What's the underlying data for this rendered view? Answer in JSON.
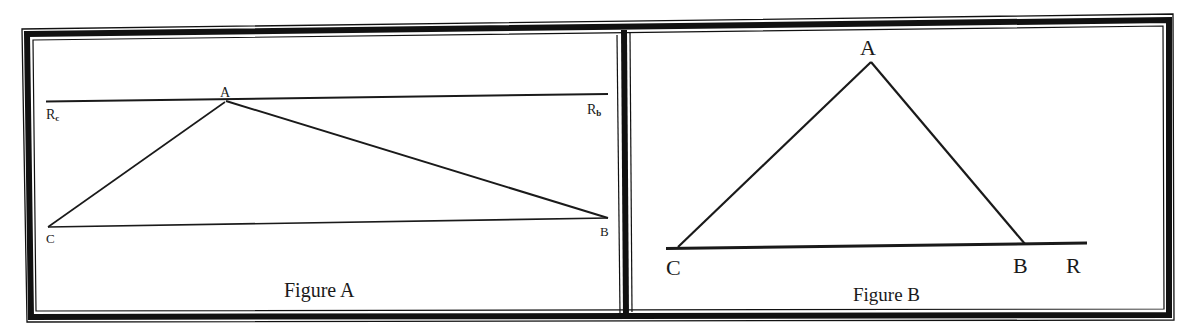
{
  "figures": [
    {
      "id": "A",
      "caption": "Figure A",
      "points": {
        "A": {
          "label": "A",
          "x": 226,
          "y": 101
        },
        "B": {
          "label": "B",
          "x": 608,
          "y": 218
        },
        "C": {
          "label": "C",
          "x": 48,
          "y": 227
        }
      },
      "line_labels": {
        "left": {
          "main": "R",
          "sub": "c"
        },
        "right": {
          "main": "R",
          "sub": "b"
        }
      },
      "description": "Triangle ABC with a line through A (Rc to Rb) parallel to base CB"
    },
    {
      "id": "B",
      "caption": "Figure B",
      "points": {
        "A": {
          "label": "A",
          "x": 871,
          "y": 62
        },
        "B": {
          "label": "B",
          "x": 1025,
          "y": 244
        },
        "C": {
          "label": "C",
          "x": 676,
          "y": 248
        }
      },
      "ray_label": "R",
      "description": "Triangle ABC with base CB extended beyond B to ray endpoint R"
    }
  ],
  "colors": {
    "ink": "#1a1a1a",
    "frame": "#111111",
    "background": "#ffffff"
  }
}
